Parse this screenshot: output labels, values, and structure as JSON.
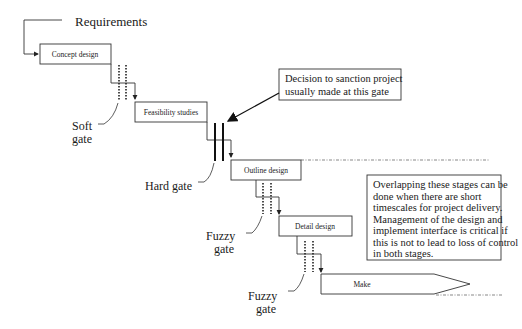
{
  "diagram": {
    "type": "stage-gate flow",
    "input_label": "Requirements",
    "stages": [
      {
        "id": "concept",
        "label": "Concept design"
      },
      {
        "id": "feasibility",
        "label": "Feasibility studies"
      },
      {
        "id": "outline",
        "label": "Outline design"
      },
      {
        "id": "detail",
        "label": "Detail design"
      },
      {
        "id": "make",
        "label": "Make"
      }
    ],
    "gates": [
      {
        "id": "gate1",
        "type": "soft",
        "label_line1": "Soft",
        "label_line2": "gate"
      },
      {
        "id": "gate2",
        "type": "hard",
        "label": "Hard gate"
      },
      {
        "id": "gate3",
        "type": "fuzzy",
        "label_line1": "Fuzzy",
        "label_line2": "gate"
      },
      {
        "id": "gate4",
        "type": "fuzzy",
        "label_line1": "Fuzzy",
        "label_line2": "gate"
      }
    ],
    "callouts": {
      "sanction": {
        "line1": "Decision to sanction project",
        "line2": "usually made at this gate"
      },
      "overlap": {
        "lines": [
          "Overlapping these stages can be",
          "done when there are short",
          "timescales for project delivery.",
          "Management of the design and",
          "implement interface is critical if",
          "this is not to lead to loss of control",
          "in both stages."
        ]
      }
    },
    "colors": {
      "line": "#333333",
      "text": "#1a1a1a",
      "background": "#ffffff"
    }
  }
}
